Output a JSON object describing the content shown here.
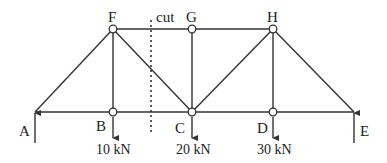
{
  "diagram": {
    "type": "truss",
    "joints": {
      "A": {
        "label": "A",
        "x": 35,
        "y": 112
      },
      "B": {
        "label": "B",
        "x": 113,
        "y": 112
      },
      "C": {
        "label": "C",
        "x": 192,
        "y": 112
      },
      "D": {
        "label": "D",
        "x": 273,
        "y": 112
      },
      "E": {
        "label": "E",
        "x": 354,
        "y": 112
      },
      "F": {
        "label": "F",
        "x": 113,
        "y": 29
      },
      "G": {
        "label": "G",
        "x": 192,
        "y": 29
      },
      "H": {
        "label": "H",
        "x": 273,
        "y": 29
      }
    },
    "members": [
      [
        "A",
        "B"
      ],
      [
        "B",
        "C"
      ],
      [
        "C",
        "D"
      ],
      [
        "D",
        "E"
      ],
      [
        "F",
        "G"
      ],
      [
        "G",
        "H"
      ],
      [
        "A",
        "F"
      ],
      [
        "F",
        "B"
      ],
      [
        "F",
        "C"
      ],
      [
        "G",
        "C"
      ],
      [
        "C",
        "H"
      ],
      [
        "H",
        "D"
      ],
      [
        "H",
        "E"
      ]
    ],
    "cut": {
      "label": "cut",
      "x": 151
    },
    "loads": [
      {
        "joint": "B",
        "label": "10 kN"
      },
      {
        "joint": "C",
        "label": "20 kN"
      },
      {
        "joint": "D",
        "label": "30 kN"
      }
    ],
    "supports": [
      {
        "joint": "A",
        "label": "A",
        "reaction": "up"
      },
      {
        "joint": "E",
        "label": "E",
        "reaction": "up"
      }
    ]
  }
}
